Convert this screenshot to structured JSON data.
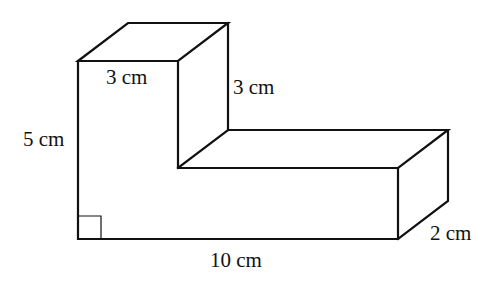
{
  "diagram": {
    "type": "3d-solid",
    "labels": {
      "top_width": "3 cm",
      "top_height": "3 cm",
      "left_height": "5 cm",
      "bottom_length": "10 cm",
      "depth": "2 cm"
    },
    "right_angle_marker": true,
    "stroke_color": "#111111",
    "background": "#ffffff"
  }
}
